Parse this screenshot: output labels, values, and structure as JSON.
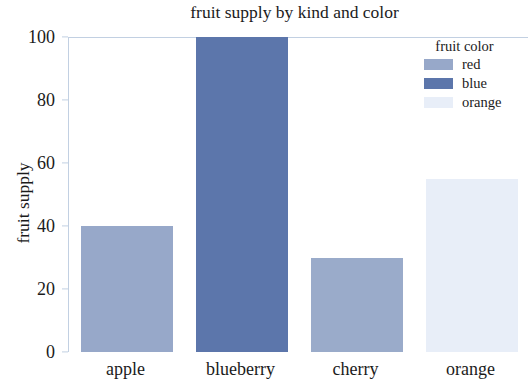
{
  "chart_data": {
    "type": "bar",
    "title": "fruit supply by kind and color",
    "xlabel": "",
    "ylabel": "fruit supply",
    "categories": [
      "apple",
      "blueberry",
      "cherry",
      "orange"
    ],
    "values": [
      40,
      100,
      30,
      55
    ],
    "bar_colors": [
      "#97a8c9",
      "#5c76ab",
      "#9aabca",
      "#e8eef8"
    ],
    "ylim": [
      0,
      100
    ],
    "yticks": [
      0,
      20,
      40,
      60,
      80,
      100
    ],
    "ytick_labels": [
      "0",
      "20",
      "40",
      "60",
      "80",
      "100"
    ],
    "grid": false,
    "legend": {
      "title": "fruit color",
      "position": "upper right",
      "frame": false,
      "entries": [
        {
          "label": "red",
          "color": "#97a8c9"
        },
        {
          "label": "blue",
          "color": "#5c76ab"
        },
        {
          "label": "orange",
          "color": "#e8eef8"
        }
      ]
    },
    "axis_color": "#c2d0e2",
    "background": "#ffffff",
    "text_color": "#1b1b1b"
  }
}
